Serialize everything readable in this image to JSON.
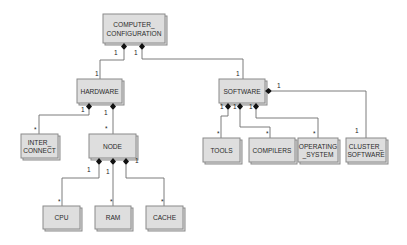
{
  "diagram": {
    "type": "UML composition class diagram",
    "classes": {
      "computer_configuration": {
        "line1": "COMPUTER_",
        "line2": "CONFIGURATION"
      },
      "hardware": {
        "label": "HARDWARE"
      },
      "software": {
        "label": "SOFTWARE"
      },
      "inter_connect": {
        "line1": "INTER_",
        "line2": "CONNECT"
      },
      "node": {
        "label": "NODE"
      },
      "tools": {
        "label": "TOOLS"
      },
      "compilers": {
        "label": "COMPILERS"
      },
      "operating_system": {
        "line1": "OPERATING",
        "line2": "_SYSTEM"
      },
      "cluster_software": {
        "line1": "CLUSTER_",
        "line2": "SOFTWARE"
      },
      "cpu": {
        "label": "CPU"
      },
      "ram": {
        "label": "RAM"
      },
      "cache": {
        "label": "CACHE"
      }
    },
    "multiplicities": {
      "cc_hw_whole": "1",
      "cc_hw_part": "1",
      "cc_sw_whole": "1",
      "cc_sw_part": "1",
      "hw_ic_whole": "1",
      "hw_ic_part": "*",
      "hw_node_whole": "1",
      "hw_node_part": "*",
      "sw_tools_whole": "1",
      "sw_tools_part": "*",
      "sw_comp_whole": "1",
      "sw_comp_part": "*",
      "sw_os_whole": "1",
      "sw_os_part": "*",
      "sw_cluster_whole": "1",
      "sw_cluster_part": "1",
      "node_cpu_whole": "1",
      "node_cpu_part": "*",
      "node_ram_whole": "1",
      "node_ram_part": "*",
      "node_cache_whole": "1",
      "node_cache_part": "*"
    },
    "relationships": [
      {
        "whole": "COMPUTER_CONFIGURATION",
        "part": "HARDWARE",
        "kind": "composition"
      },
      {
        "whole": "COMPUTER_CONFIGURATION",
        "part": "SOFTWARE",
        "kind": "composition"
      },
      {
        "whole": "HARDWARE",
        "part": "INTER_CONNECT",
        "kind": "composition"
      },
      {
        "whole": "HARDWARE",
        "part": "NODE",
        "kind": "composition"
      },
      {
        "whole": "SOFTWARE",
        "part": "TOOLS",
        "kind": "composition"
      },
      {
        "whole": "SOFTWARE",
        "part": "COMPILERS",
        "kind": "composition"
      },
      {
        "whole": "SOFTWARE",
        "part": "OPERATING_SYSTEM",
        "kind": "composition"
      },
      {
        "whole": "SOFTWARE",
        "part": "CLUSTER_SOFTWARE",
        "kind": "composition"
      },
      {
        "whole": "NODE",
        "part": "CPU",
        "kind": "composition"
      },
      {
        "whole": "NODE",
        "part": "RAM",
        "kind": "composition"
      },
      {
        "whole": "NODE",
        "part": "CACHE",
        "kind": "composition"
      }
    ],
    "colors": {
      "box_fill": "#dedede",
      "box_border": "#8a8a8a",
      "line": "#6e6e6e",
      "diamond": "#111111",
      "text": "#2a2a2a"
    }
  }
}
